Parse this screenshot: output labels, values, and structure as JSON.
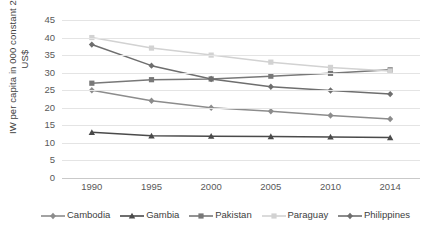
{
  "chart_data": {
    "type": "line",
    "title": "",
    "xlabel": "",
    "ylabel": "IW per capita in 000 constant 2005\nUS$",
    "categories": [
      "1990",
      "1995",
      "2000",
      "2005",
      "2010",
      "2014"
    ],
    "x": [
      1990,
      1995,
      2000,
      2005,
      2010,
      2014
    ],
    "ylim": [
      0,
      45
    ],
    "yticks": [
      "0",
      "5",
      "10",
      "15",
      "20",
      "25",
      "30",
      "35",
      "40",
      "45"
    ],
    "grid": true,
    "legend_position": "bottom",
    "series": [
      {
        "name": "Cambodia",
        "color": "#8c8c8c",
        "marker": "diamond",
        "values": [
          25,
          22,
          20,
          19,
          17.8,
          16.8
        ]
      },
      {
        "name": "Gambia",
        "color": "#4a4a4a",
        "marker": "triangle",
        "values": [
          13,
          12,
          11.9,
          11.8,
          11.7,
          11.5
        ]
      },
      {
        "name": "Pakistan",
        "color": "#787878",
        "marker": "square",
        "values": [
          27,
          28,
          28.2,
          29,
          29.8,
          30.8
        ]
      },
      {
        "name": "Paraguay",
        "color": "#d2d2d2",
        "marker": "square",
        "values": [
          40,
          37,
          35,
          33,
          31.5,
          30.5
        ]
      },
      {
        "name": "Philippines",
        "color": "#6e6e6e",
        "marker": "diamond",
        "values": [
          38,
          32,
          28.2,
          26,
          24.9,
          23.9
        ]
      }
    ]
  },
  "legend": {
    "items": [
      {
        "label": "Cambodia"
      },
      {
        "label": "Gambia"
      },
      {
        "label": "Pakistan"
      },
      {
        "label": "Paraguay"
      },
      {
        "label": "Philippines"
      }
    ]
  }
}
